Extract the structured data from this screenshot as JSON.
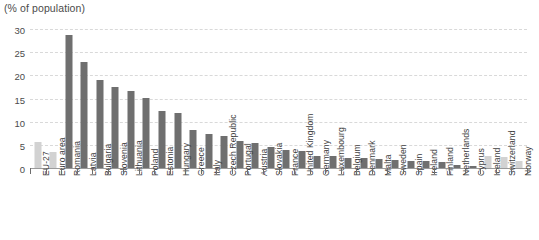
{
  "chart_data": {
    "type": "bar",
    "title": "(% of population)",
    "xlabel": "",
    "ylabel": "(% of population)",
    "ylim": [
      0,
      30
    ],
    "yticks": [
      0,
      5,
      10,
      15,
      20,
      25,
      30
    ],
    "grid": true,
    "legend": "none",
    "orientation": "vertical",
    "categories": [
      "EU-27",
      "Euro area",
      "Romania",
      "Latvia",
      "Bulgaria",
      "Slovenia",
      "Lithuania",
      "Poland",
      "Estonia",
      "Hungary",
      "Greece",
      "Italy",
      "Czech Republic",
      "Portugal",
      "Austria",
      "Slovakia",
      "France",
      "United Kingdom",
      "Germany",
      "Luxembourg",
      "Belgium",
      "Denmark",
      "Malta",
      "Sweden",
      "Spain",
      "Ireland",
      "Finland",
      "Netherlands",
      "Cyprus",
      "Iceland",
      "Switzerland",
      "Norway"
    ],
    "values": [
      5.7,
      3.5,
      28.7,
      22.8,
      18.9,
      17.4,
      16.7,
      15.2,
      12.3,
      11.8,
      8.1,
      7.3,
      6.9,
      5.8,
      5.5,
      4.6,
      3.9,
      3.6,
      2.6,
      2.5,
      2.2,
      2.1,
      2.0,
      1.7,
      1.6,
      1.5,
      1.3,
      0.6,
      0.5,
      2.5,
      2.3,
      1.5
    ],
    "bar_styles": [
      "light",
      "light",
      "dark",
      "dark",
      "dark",
      "dark",
      "dark",
      "dark",
      "dark",
      "dark",
      "dark",
      "dark",
      "dark",
      "dark",
      "dark",
      "dark",
      "dark",
      "dark",
      "dark",
      "dark",
      "dark",
      "dark",
      "dark",
      "dark",
      "dark",
      "dark",
      "dark",
      "dark",
      "dark",
      "light",
      "light",
      "light"
    ],
    "colors": {
      "bar_dark": "#6f6f6f",
      "bar_light": "#d2d2d2",
      "gridline": "#d9d9d9",
      "axis": "#9a9a9a",
      "text": "#3f3f3f"
    }
  }
}
